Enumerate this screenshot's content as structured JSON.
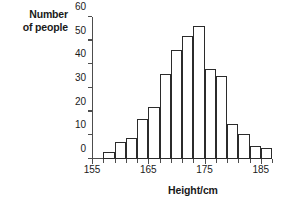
{
  "chart_data": {
    "type": "bar",
    "title": "",
    "xlabel": "Height/cm",
    "ylabel": "Number of people",
    "ylabel_line1": "Number",
    "ylabel_line2": "of people",
    "xlim": [
      155,
      187
    ],
    "ylim": [
      0,
      60
    ],
    "grid": false,
    "legend": false,
    "bin_width": 2,
    "x_tick_step": 2,
    "y_tick_step": 10,
    "y_ticks": [
      0,
      10,
      20,
      30,
      40,
      50,
      60
    ],
    "y_tick_labels": [
      "0",
      "10",
      "20",
      "30",
      "40",
      "50",
      "60"
    ],
    "x_ticks": [
      155,
      157,
      159,
      161,
      163,
      165,
      167,
      169,
      171,
      173,
      175,
      177,
      179,
      181,
      183,
      185,
      187
    ],
    "x_labeled_ticks": [
      155,
      165,
      175,
      185
    ],
    "x_tick_labels": [
      "155",
      "165",
      "175",
      "185"
    ],
    "categories": [
      "157-159",
      "159-161",
      "161-163",
      "163-165",
      "165-167",
      "167-169",
      "169-171",
      "171-173",
      "173-175",
      "175-177",
      "177-179",
      "179-181",
      "181-183",
      "183-185",
      "185-187"
    ],
    "bin_starts": [
      157,
      159,
      161,
      163,
      165,
      167,
      169,
      171,
      173,
      175,
      177,
      179,
      181,
      183,
      185
    ],
    "values": [
      3,
      7,
      9,
      17,
      22,
      36,
      46,
      52,
      56,
      38,
      35,
      15,
      10.5,
      5.5,
      4.5
    ],
    "bar_fill": "#ffffff",
    "bar_stroke": "#2b2b2b",
    "axis_color": "#4d4d4d",
    "text_color": "#1a1a1a"
  }
}
